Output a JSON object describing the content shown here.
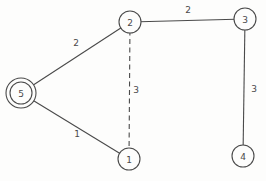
{
  "figure": {
    "width": 266,
    "height": 181,
    "background_color": "#fdfdfc",
    "stroke_color": "#4a4a4a",
    "label_color": "#4a4a4a",
    "node_fill_color": "#fdfdfc"
  },
  "graph": {
    "type": "undirected-weighted-graph",
    "nodes": [
      {
        "id": "1",
        "label": "1",
        "x": 129,
        "y": 159,
        "r": 11,
        "double": false
      },
      {
        "id": "2",
        "label": "2",
        "x": 130,
        "y": 22,
        "r": 11,
        "double": false
      },
      {
        "id": "3",
        "label": "3",
        "x": 245,
        "y": 19,
        "r": 11,
        "double": false
      },
      {
        "id": "4",
        "label": "4",
        "x": 243,
        "y": 156,
        "r": 11,
        "double": false
      },
      {
        "id": "5",
        "label": "5",
        "x": 21,
        "y": 93,
        "r": 11,
        "double": true,
        "outer_r": 15
      }
    ],
    "edges": [
      {
        "from": "5",
        "to": "2",
        "weight": "2",
        "style": "solid",
        "label_x": 76,
        "label_y": 42
      },
      {
        "from": "2",
        "to": "3",
        "weight": "2",
        "style": "solid",
        "label_x": 188,
        "label_y": 9
      },
      {
        "from": "3",
        "to": "4",
        "weight": "3",
        "style": "solid",
        "label_x": 254,
        "label_y": 88
      },
      {
        "from": "5",
        "to": "1",
        "weight": "1",
        "style": "solid",
        "label_x": 77,
        "label_y": 133
      },
      {
        "from": "2",
        "to": "1",
        "weight": "3",
        "style": "dashed",
        "label_x": 136,
        "label_y": 89
      }
    ]
  }
}
